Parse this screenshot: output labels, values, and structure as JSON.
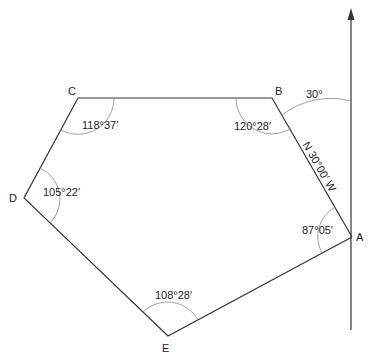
{
  "diagram": {
    "type": "traverse-polygon",
    "vertices": [
      {
        "id": "A",
        "label": "A",
        "interior_angle": "87°05′"
      },
      {
        "id": "B",
        "label": "B",
        "interior_angle": "120°28′"
      },
      {
        "id": "C",
        "label": "C",
        "interior_angle": "118°37′"
      },
      {
        "id": "D",
        "label": "D",
        "interior_angle": "105°22′"
      },
      {
        "id": "E",
        "label": "E",
        "interior_angle": "108°28′"
      }
    ],
    "north_angle": "30°",
    "bearing_AB": "N 30°00′ W",
    "line_color": "#333333",
    "arc_color": "#888888"
  }
}
